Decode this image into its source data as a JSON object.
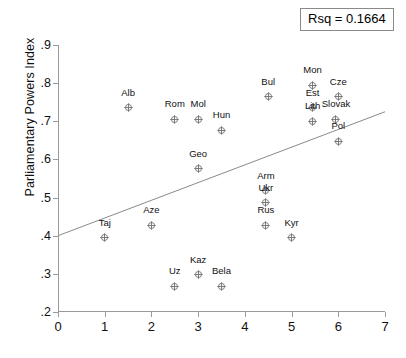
{
  "chart_data": {
    "type": "scatter",
    "title": "",
    "xlabel": "",
    "ylabel": "Parliamentary Powers Index",
    "xlim": [
      0,
      7
    ],
    "ylim": [
      0.2,
      0.9
    ],
    "xticks": [
      "0",
      "1",
      "2",
      "3",
      "4",
      "5",
      "6",
      "7"
    ],
    "xtick_values": [
      0,
      1,
      2,
      3,
      4,
      5,
      6,
      7
    ],
    "yticks": [
      ".2",
      ".3",
      ".4",
      ".5",
      ".6",
      ".7",
      ".8",
      ".9"
    ],
    "ytick_values": [
      0.2,
      0.3,
      0.4,
      0.5,
      0.6,
      0.7,
      0.8,
      0.9
    ],
    "grid": false,
    "legend": null,
    "annotations": [
      {
        "name": "rsq",
        "text": "Rsq = 0.1664",
        "value": 0.1664
      }
    ],
    "fit_line": {
      "type": "linear-regression",
      "x_start": 0,
      "y_start": 0.4,
      "x_end": 7,
      "y_end": 0.725
    },
    "points": [
      {
        "label": "Alb",
        "x": 1.5,
        "y": 0.748,
        "label_pos": "above"
      },
      {
        "label": "Rom",
        "x": 2.5,
        "y": 0.719,
        "label_pos": "above"
      },
      {
        "label": "Mol",
        "x": 3.0,
        "y": 0.719,
        "label_pos": "above"
      },
      {
        "label": "Hun",
        "x": 3.5,
        "y": 0.689,
        "label_pos": "above"
      },
      {
        "label": "Bul",
        "x": 4.5,
        "y": 0.777,
        "label_pos": "above"
      },
      {
        "label": "Mon",
        "x": 5.45,
        "y": 0.807,
        "label_pos": "above"
      },
      {
        "label": "Cze",
        "x": 6.0,
        "y": 0.777,
        "label_pos": "above"
      },
      {
        "label": "Est",
        "x": 5.45,
        "y": 0.748,
        "label_pos": "above"
      },
      {
        "label": "Lith",
        "x": 5.45,
        "y": 0.713,
        "label_pos": "above"
      },
      {
        "label": "Slovak",
        "x": 5.95,
        "y": 0.719,
        "label_pos": "above"
      },
      {
        "label": "Pol",
        "x": 6.0,
        "y": 0.661,
        "label_pos": "above"
      },
      {
        "label": "Geo",
        "x": 3.0,
        "y": 0.589,
        "label_pos": "above"
      },
      {
        "label": "Arm",
        "x": 4.45,
        "y": 0.531,
        "label_pos": "above"
      },
      {
        "label": "Ukr",
        "x": 4.45,
        "y": 0.5,
        "label_pos": "above"
      },
      {
        "label": "Rus",
        "x": 4.45,
        "y": 0.44,
        "label_pos": "above"
      },
      {
        "label": "Kyr",
        "x": 5.0,
        "y": 0.408,
        "label_pos": "above"
      },
      {
        "label": "Aze",
        "x": 2.0,
        "y": 0.44,
        "label_pos": "above"
      },
      {
        "label": "Taj",
        "x": 1.0,
        "y": 0.408,
        "label_pos": "above"
      },
      {
        "label": "Kaz",
        "x": 3.0,
        "y": 0.311,
        "label_pos": "above"
      },
      {
        "label": "Uz",
        "x": 2.5,
        "y": 0.28,
        "label_pos": "above"
      },
      {
        "label": "Bela",
        "x": 3.5,
        "y": 0.28,
        "label_pos": "above"
      }
    ]
  },
  "colors": {
    "axis": "#9a9a9a",
    "marker": "#6f6f6f",
    "fit_line": "#8a8a8a",
    "text": "#111111",
    "background": "#ffffff",
    "box_border": "#8a8a8a"
  }
}
